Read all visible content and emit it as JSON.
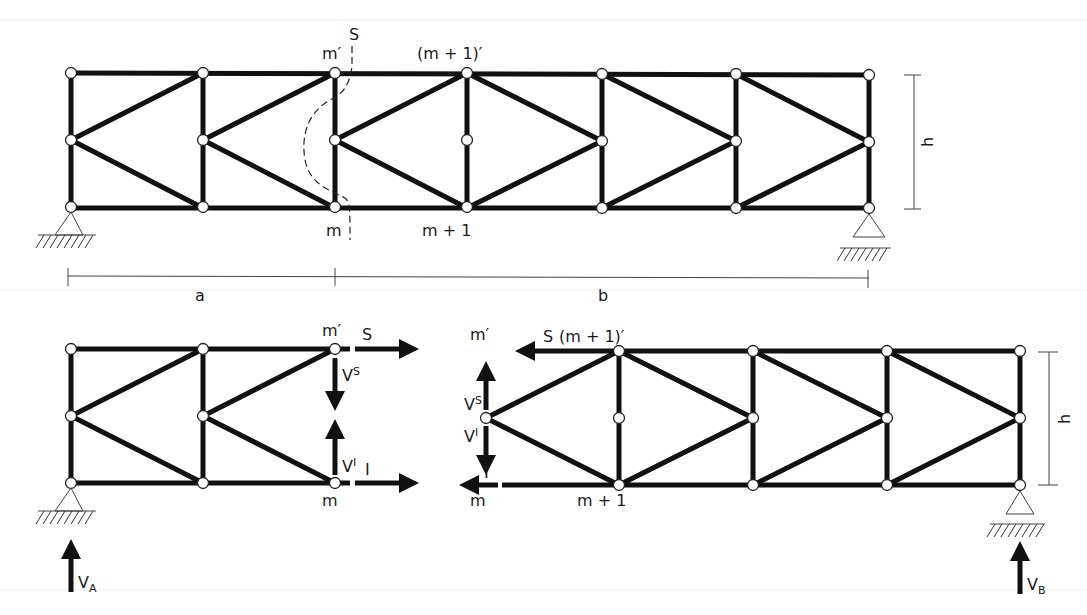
{
  "figure": {
    "colors": {
      "member": "#111111",
      "node_fill": "#ffffff",
      "background": "#ffffff"
    }
  },
  "top_truss": {
    "labels": {
      "m_prime": "m′",
      "m1_prime": "(m + 1)′",
      "m": "m",
      "m1": "m + 1",
      "cut": "S",
      "height": "h",
      "dim_a": "a",
      "dim_b": "b"
    },
    "node_columns_x": [
      71,
      203,
      335,
      467,
      602,
      736,
      869
    ],
    "rows_y": [
      73,
      140,
      208
    ]
  },
  "left_part": {
    "labels": {
      "m_prime": "m′",
      "m": "m",
      "force_top": "S",
      "force_bottom": "I",
      "shear_top": "V",
      "shear_top_sup": "S",
      "shear_bottom": "V",
      "shear_bottom_sup": "I",
      "reaction": "V",
      "reaction_sub": "A"
    }
  },
  "right_part": {
    "labels": {
      "m_prime": "m′",
      "m1_prime": "(m + 1)′",
      "m": "m",
      "m1": "m + 1",
      "force_top": "S",
      "force_bottom": "I",
      "shear_top": "V",
      "shear_top_sup": "S",
      "shear_bottom": "V",
      "shear_bottom_sup": "I",
      "height": "h",
      "reaction": "V",
      "reaction_sub": "B"
    }
  }
}
